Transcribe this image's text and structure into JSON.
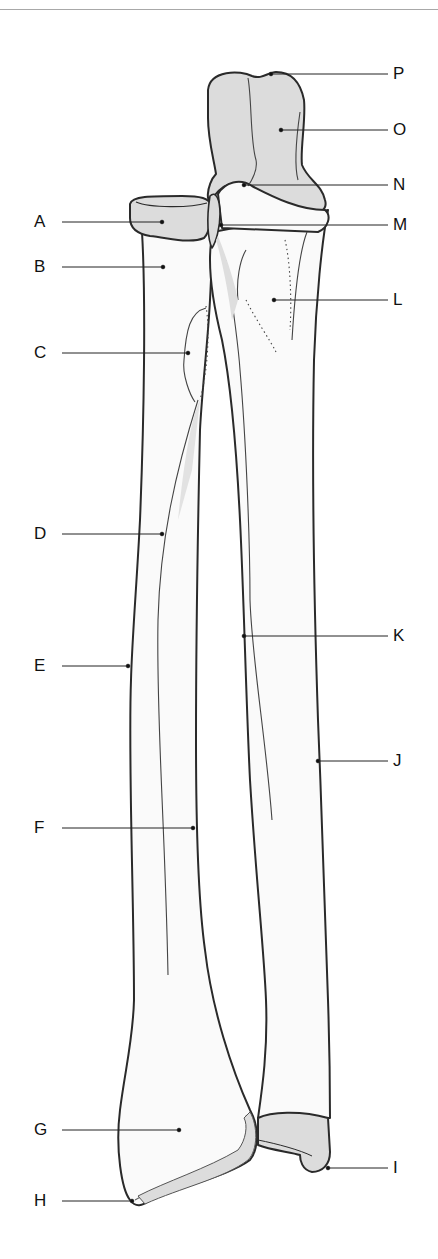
{
  "diagram": {
    "colors": {
      "outline": "#2a2a2a",
      "articular_fill": "#dcdcdc",
      "bone_fill": "#fafafa",
      "leader": "#222222",
      "top_rule": "#a8a8a8"
    },
    "labels": [
      {
        "id": "A",
        "text": "A",
        "side": "left",
        "label_x": 30,
        "y": 222,
        "point_x": 162,
        "point_y": 222
      },
      {
        "id": "B",
        "text": "B",
        "side": "left",
        "label_x": 30,
        "y": 267,
        "point_x": 163,
        "point_y": 267
      },
      {
        "id": "C",
        "text": "C",
        "side": "left",
        "label_x": 30,
        "y": 353,
        "point_x": 188,
        "point_y": 353
      },
      {
        "id": "D",
        "text": "D",
        "side": "left",
        "label_x": 30,
        "y": 534,
        "point_x": 162,
        "point_y": 534
      },
      {
        "id": "E",
        "text": "E",
        "side": "left",
        "label_x": 30,
        "y": 666,
        "point_x": 128,
        "point_y": 666
      },
      {
        "id": "F",
        "text": "F",
        "side": "left",
        "label_x": 30,
        "y": 828,
        "point_x": 193,
        "point_y": 828
      },
      {
        "id": "G",
        "text": "G",
        "side": "left",
        "label_x": 30,
        "y": 1130,
        "point_x": 179,
        "point_y": 1130
      },
      {
        "id": "H",
        "text": "H",
        "side": "left",
        "label_x": 30,
        "y": 1201,
        "point_x": 132,
        "point_y": 1201
      },
      {
        "id": "I",
        "text": "I",
        "side": "right",
        "label_x": 393,
        "y": 1168,
        "point_x": 328,
        "point_y": 1168
      },
      {
        "id": "J",
        "text": "J",
        "side": "right",
        "label_x": 393,
        "y": 761,
        "point_x": 318,
        "point_y": 761
      },
      {
        "id": "K",
        "text": "K",
        "side": "right",
        "label_x": 393,
        "y": 636,
        "point_x": 244,
        "point_y": 636
      },
      {
        "id": "L",
        "text": "L",
        "side": "right",
        "label_x": 393,
        "y": 300,
        "point_x": 274,
        "point_y": 300
      },
      {
        "id": "M",
        "text": "M",
        "side": "right",
        "label_x": 393,
        "y": 225,
        "point_x": 221,
        "point_y": 225
      },
      {
        "id": "N",
        "text": "N",
        "side": "right",
        "label_x": 393,
        "y": 185,
        "point_x": 244,
        "point_y": 185
      },
      {
        "id": "O",
        "text": "O",
        "side": "right",
        "label_x": 393,
        "y": 130,
        "point_x": 281,
        "point_y": 130
      },
      {
        "id": "P",
        "text": "P",
        "side": "right",
        "label_x": 393,
        "y": 74,
        "point_x": 271,
        "point_y": 74
      }
    ]
  }
}
